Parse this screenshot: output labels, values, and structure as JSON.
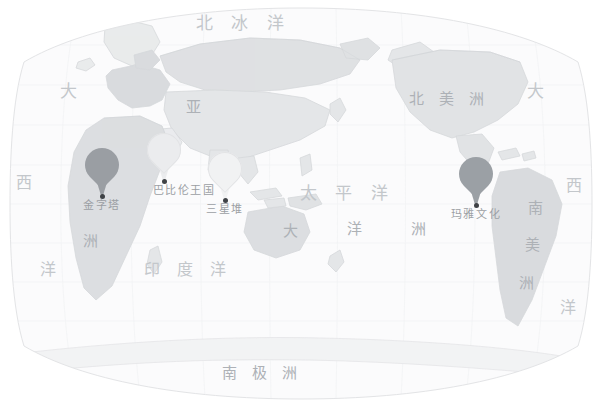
{
  "map": {
    "title": "世界古文明分布图",
    "projection": "robinson",
    "background_color": "#ffffff",
    "ocean_fill": "#fbfbfc",
    "land_fill": "#e9eaec",
    "land_highlight_fill": "#d8dadd",
    "land_stroke": "#d2d4d7",
    "graticule_color": "#f2f3f4",
    "label_color": "#bcbfc3"
  },
  "ocean_labels": [
    {
      "name": "arctic-ocean",
      "text": "北 冰 洋",
      "x": 196,
      "y": 15,
      "size": 17,
      "class": "ocean"
    },
    {
      "name": "pacific-ocean",
      "text": "太 平 洋",
      "x": 300,
      "y": 185,
      "size": 17,
      "class": "ocean"
    },
    {
      "name": "indian-ocean",
      "text": "印 度 洋",
      "x": 144,
      "y": 262,
      "size": 16,
      "class": "ocean"
    },
    {
      "name": "atlantic-ocean-west-top",
      "text": "大",
      "x": 60,
      "y": 83,
      "size": 17,
      "class": "ocean"
    },
    {
      "name": "atlantic-ocean-west-mid",
      "text": "西",
      "x": 16,
      "y": 175,
      "size": 16,
      "class": "ocean"
    },
    {
      "name": "atlantic-ocean-west-bottom",
      "text": "洋",
      "x": 40,
      "y": 262,
      "size": 16,
      "class": "ocean"
    },
    {
      "name": "atlantic-ocean-east-top",
      "text": "大",
      "x": 527,
      "y": 83,
      "size": 17,
      "class": "ocean"
    },
    {
      "name": "atlantic-ocean-east-mid",
      "text": "西",
      "x": 566,
      "y": 178,
      "size": 16,
      "class": "ocean"
    },
    {
      "name": "atlantic-ocean-east-bottom",
      "text": "洋",
      "x": 560,
      "y": 300,
      "size": 16,
      "class": "ocean"
    }
  ],
  "continent_labels": [
    {
      "name": "asia",
      "text": "亚",
      "x": 186,
      "y": 100,
      "size": 15,
      "class": "cont"
    },
    {
      "name": "asia-zhou",
      "text": "洲",
      "x": 83,
      "y": 234,
      "size": 15,
      "class": "cont"
    },
    {
      "name": "north-america",
      "text": "北 美 洲",
      "x": 409,
      "y": 92,
      "size": 15,
      "class": "cont"
    },
    {
      "name": "south-america-nan",
      "text": "南",
      "x": 528,
      "y": 201,
      "size": 15,
      "class": "cont"
    },
    {
      "name": "south-america-mei",
      "text": "美",
      "x": 525,
      "y": 238,
      "size": 15,
      "class": "cont"
    },
    {
      "name": "south-america-zhou",
      "text": "洲",
      "x": 519,
      "y": 276,
      "size": 15,
      "class": "cont"
    },
    {
      "name": "oceania-da",
      "text": "大",
      "x": 283,
      "y": 224,
      "size": 15,
      "class": "cont"
    },
    {
      "name": "oceania-yang",
      "text": "洋",
      "x": 347,
      "y": 222,
      "size": 15,
      "class": "cont"
    },
    {
      "name": "oceania-zhou",
      "text": "洲",
      "x": 411,
      "y": 222,
      "size": 15,
      "class": "cont"
    },
    {
      "name": "antarctica",
      "text": "南    极    洲",
      "x": 222,
      "y": 366,
      "size": 15,
      "class": "cont"
    }
  ],
  "pins": [
    {
      "name": "pin-pyramids",
      "label": "金字塔",
      "x": 102,
      "y": 148,
      "color": "#9a9ea3",
      "dark": true,
      "label_size": 11
    },
    {
      "name": "pin-babylon",
      "label": "巴比伦王国",
      "x": 164,
      "y": 133,
      "color": "#ebecee",
      "dark": false,
      "label_size": 11,
      "label_shift": true
    },
    {
      "name": "pin-sanxingdui",
      "label": "三星堆",
      "x": 225,
      "y": 152,
      "color": "#f1f2f3",
      "dark": false,
      "label_size": 11
    },
    {
      "name": "pin-maya",
      "label": "玛雅文化",
      "x": 476,
      "y": 157,
      "color": "#9ba0a5",
      "dark": true,
      "label_size": 11
    }
  ]
}
